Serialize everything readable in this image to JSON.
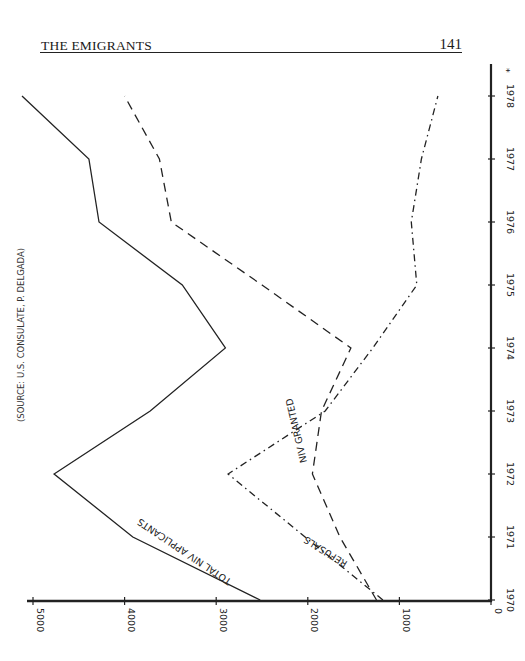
{
  "header": {
    "title": "THE EMIGRANTS",
    "page_number": "141"
  },
  "chart_data": {
    "type": "line",
    "orientation": "rotated-90",
    "title": "",
    "source_note": "(SOURCE: U.S. CONSULATE, P. DELGADA)",
    "x": [
      "1970",
      "1971",
      "1972",
      "1973",
      "1974",
      "1975",
      "1976",
      "1977",
      "1978"
    ],
    "xlabel": "",
    "ylabel": "",
    "ylim": [
      0,
      5000
    ],
    "yticks": [
      "0",
      "1000",
      "2000",
      "3000",
      "4000",
      "5000"
    ],
    "grid": false,
    "legend": "inline labels",
    "corner_mark": "*",
    "series": [
      {
        "name": "TOTAL NIV APPLICANTS",
        "style": "solid",
        "values": [
          2520,
          3910,
          4770,
          3720,
          2900,
          3370,
          4280,
          4390,
          5120
        ]
      },
      {
        "name": "NIV GRANTED",
        "style": "dashed",
        "values": [
          1250,
          1650,
          1950,
          1850,
          1530,
          2500,
          3490,
          3620,
          4000
        ]
      },
      {
        "name": "REFUSALS",
        "style": "dash-dot",
        "values": [
          1180,
          2030,
          2870,
          1810,
          1290,
          810,
          870,
          760,
          580
        ]
      }
    ]
  }
}
